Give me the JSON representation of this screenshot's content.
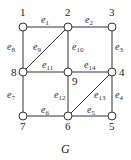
{
  "graph": {
    "caption": "G",
    "nodes": [
      {
        "id": "1",
        "label": "1",
        "x": 23,
        "y": 27,
        "lx": 20,
        "ly": 16
      },
      {
        "id": "2",
        "label": "2",
        "x": 68,
        "y": 27,
        "lx": 65,
        "ly": 16
      },
      {
        "id": "3",
        "label": "3",
        "x": 112,
        "y": 27,
        "lx": 109,
        "ly": 16
      },
      {
        "id": "4",
        "label": "4",
        "x": 112,
        "y": 72,
        "lx": 119,
        "ly": 76
      },
      {
        "id": "5",
        "label": "5",
        "x": 112,
        "y": 116,
        "lx": 109,
        "ly": 130
      },
      {
        "id": "6",
        "label": "6",
        "x": 68,
        "y": 116,
        "lx": 65,
        "ly": 130
      },
      {
        "id": "7",
        "label": "7",
        "x": 23,
        "y": 116,
        "lx": 20,
        "ly": 130
      },
      {
        "id": "8",
        "label": "8",
        "x": 23,
        "y": 72,
        "lx": 11,
        "ly": 76
      },
      {
        "id": "9",
        "label": "9",
        "x": 68,
        "y": 72,
        "lx": 72,
        "ly": 85
      }
    ],
    "edges": [
      {
        "id": "e1",
        "base": "e",
        "sub": "1",
        "from": "1",
        "to": "2",
        "lx": 41,
        "ly": 23
      },
      {
        "id": "e2",
        "base": "e",
        "sub": "2",
        "from": "2",
        "to": "3",
        "lx": 85,
        "ly": 23
      },
      {
        "id": "e3",
        "base": "e",
        "sub": "3",
        "from": "3",
        "to": "4",
        "lx": 115,
        "ly": 50
      },
      {
        "id": "e4",
        "base": "e",
        "sub": "4",
        "from": "4",
        "to": "5",
        "lx": 115,
        "ly": 98
      },
      {
        "id": "e5",
        "base": "e",
        "sub": "5",
        "from": "5",
        "to": "6",
        "lx": 87,
        "ly": 113
      },
      {
        "id": "e6",
        "base": "e",
        "sub": "6",
        "from": "6",
        "to": "7",
        "lx": 41,
        "ly": 113
      },
      {
        "id": "e7",
        "base": "e",
        "sub": "7",
        "from": "7",
        "to": "8",
        "lx": 7,
        "ly": 98
      },
      {
        "id": "e8",
        "base": "e",
        "sub": "8",
        "from": "8",
        "to": "1",
        "lx": 7,
        "ly": 50
      },
      {
        "id": "e9",
        "base": "e",
        "sub": "9",
        "from": "2",
        "to": "8",
        "lx": 33,
        "ly": 50
      },
      {
        "id": "e10",
        "base": "e",
        "sub": "10",
        "from": "2",
        "to": "9",
        "lx": 72,
        "ly": 50
      },
      {
        "id": "e11",
        "base": "e",
        "sub": "11",
        "from": "8",
        "to": "9",
        "lx": 42,
        "ly": 68
      },
      {
        "id": "e12",
        "base": "e",
        "sub": "12",
        "from": "9",
        "to": "6",
        "lx": 54,
        "ly": 98
      },
      {
        "id": "e13",
        "base": "e",
        "sub": "13",
        "from": "4",
        "to": "6",
        "lx": 94,
        "ly": 98
      },
      {
        "id": "e14",
        "base": "e",
        "sub": "14",
        "from": "9",
        "to": "4",
        "lx": 84,
        "ly": 68
      }
    ]
  }
}
